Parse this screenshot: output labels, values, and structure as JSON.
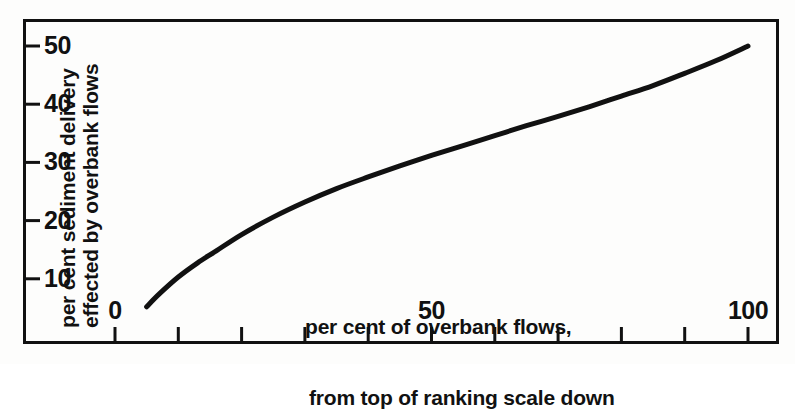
{
  "figure": {
    "background_color": "#fdfdfc",
    "ink_color": "#111111"
  },
  "y_axis": {
    "title_line_1": "per cent sediment delivery",
    "title_line_2": "effected by overbank flows",
    "tick_labels": [
      "50",
      "40",
      "30",
      "20",
      "10"
    ],
    "tick_values": [
      50,
      40,
      30,
      20,
      10
    ],
    "range": [
      0,
      55
    ]
  },
  "x_axis": {
    "caption_line_1": "per cent of overbank flows,",
    "caption_line_2": "from top of ranking scale down",
    "tick_labels": [
      "0",
      "50",
      "100"
    ],
    "tick_values": [
      0,
      10,
      20,
      30,
      40,
      50,
      60,
      70,
      80,
      90,
      100
    ],
    "labelled_ticks": [
      0,
      50,
      100
    ],
    "range": [
      -15,
      105
    ]
  },
  "chart_data": {
    "type": "line",
    "title": "",
    "subtitle": "",
    "xlabel": "per cent of overbank flows, from top of ranking scale down",
    "ylabel": "per cent sediment delivery effected by overbank flows",
    "xlim": [
      -15,
      105
    ],
    "ylim": [
      0,
      55
    ],
    "grid": false,
    "legend": false,
    "xticks": [
      0,
      10,
      20,
      30,
      40,
      50,
      60,
      70,
      80,
      90,
      100
    ],
    "xticklabels": [
      "0",
      "",
      "",
      "",
      "",
      "50",
      "",
      "",
      "",
      "",
      "100"
    ],
    "yticks": [
      10,
      20,
      30,
      40,
      50
    ],
    "yticklabels": [
      "10",
      "20",
      "30",
      "40",
      "50"
    ],
    "series": [
      {
        "name": "sediment delivery curve",
        "color": "#111111",
        "linewidth": 5,
        "x": [
          5,
          7,
          10,
          13,
          16,
          20,
          25,
          30,
          35,
          40,
          45,
          50,
          55,
          60,
          65,
          70,
          75,
          80,
          85,
          90,
          95,
          100
        ],
        "y": [
          5.2,
          7.4,
          10.3,
          12.7,
          14.8,
          17.6,
          20.6,
          23.2,
          25.5,
          27.5,
          29.4,
          31.2,
          32.9,
          34.6,
          36.3,
          37.9,
          39.6,
          41.4,
          43.2,
          45.3,
          47.5,
          50.0
        ]
      }
    ]
  }
}
